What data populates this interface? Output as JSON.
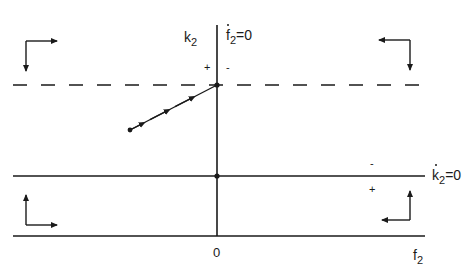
{
  "diagram": {
    "type": "phase-diagram",
    "colors": {
      "ink": "#1a1a1a",
      "background": "#ffffff"
    },
    "axes": {
      "vertical_label_base": "k",
      "vertical_label_sub": "2",
      "horizontal_label_base": "f",
      "horizontal_label_sub": "2",
      "origin_label": "0"
    },
    "isoclines": {
      "f2_dot_zero": {
        "base": "f",
        "sub": "2",
        "rhs": "=0",
        "left_sign": "+",
        "right_sign": "-"
      },
      "k2_dot_zero": {
        "base": "k",
        "sub": "2",
        "rhs": "=0",
        "above_sign": "-",
        "below_sign": "+"
      }
    },
    "lines": {
      "dashed_steady_state_k2": {
        "y": 85,
        "x_start": 13,
        "x_end": 425,
        "style": "dashed"
      },
      "k2_dot_zero_line": {
        "y": 176,
        "x_start": 13,
        "x_end": 425,
        "style": "solid"
      },
      "horizontal_axis": {
        "y": 236,
        "x_start": 13,
        "x_end": 425,
        "style": "solid"
      },
      "vertical_axis": {
        "x": 217,
        "y_start": 25,
        "y_end": 236,
        "style": "solid"
      }
    },
    "saddle_path": {
      "start": [
        130,
        130
      ],
      "end": [
        217,
        85
      ],
      "arrow_count": 3
    },
    "equilibrium_points": [
      [
        217,
        85
      ],
      [
        217,
        176
      ]
    ],
    "direction_arrows": [
      {
        "region": "top-left",
        "horizontal": "right",
        "vertical": "down"
      },
      {
        "region": "top-right",
        "horizontal": "left",
        "vertical": "down"
      },
      {
        "region": "bottom-left",
        "horizontal": "right",
        "vertical": "up"
      },
      {
        "region": "bottom-right",
        "horizontal": "left",
        "vertical": "up"
      }
    ]
  }
}
